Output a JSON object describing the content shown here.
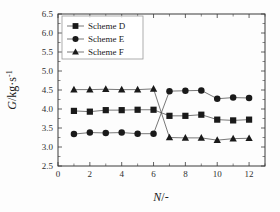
{
  "chart_data": {
    "type": "line",
    "title": "",
    "xlabel": "N/-",
    "ylabel": "G/kg·s⁻¹",
    "ylabel_main": "G",
    "ylabel_unit": "/kg·s",
    "ylabel_exp": "-1",
    "xlabel_main": "N",
    "xlabel_unit": "/-",
    "xlim": [
      0,
      13
    ],
    "ylim": [
      2.5,
      6.5
    ],
    "grid": false,
    "legend_position": "upper-left",
    "x_ticks": [
      0,
      2,
      4,
      6,
      8,
      10,
      12
    ],
    "x_tick_labels": [
      "0",
      "2",
      "4",
      "6",
      "8",
      "10",
      "12"
    ],
    "x_minor_ticks": [
      1,
      3,
      5,
      7,
      9,
      11,
      13
    ],
    "y_ticks": [
      2.5,
      3.0,
      3.5,
      4.0,
      4.5,
      5.0,
      5.5,
      6.0,
      6.5
    ],
    "y_tick_labels": [
      "2.5",
      "3.0",
      "3.5",
      "4.0",
      "4.5",
      "5.0",
      "5.5",
      "6.0",
      "6.5"
    ],
    "x": [
      1,
      2,
      3,
      4,
      5,
      6,
      7,
      8,
      9,
      10,
      11,
      12
    ],
    "series": [
      {
        "name": "Scheme  D",
        "marker": "square",
        "color": "#1a1a1a",
        "values": [
          3.95,
          3.93,
          3.97,
          3.97,
          3.98,
          3.98,
          3.82,
          3.82,
          3.85,
          3.72,
          3.7,
          3.72
        ]
      },
      {
        "name": "Scheme  E",
        "marker": "circle",
        "color": "#1a1a1a",
        "values": [
          3.34,
          3.38,
          3.37,
          3.38,
          3.35,
          3.35,
          4.47,
          4.48,
          4.49,
          4.27,
          4.3,
          4.29
        ]
      },
      {
        "name": "Scheme  F",
        "marker": "triangle",
        "color": "#1a1a1a",
        "values": [
          4.51,
          4.51,
          4.52,
          4.51,
          4.51,
          4.53,
          3.25,
          3.24,
          3.24,
          3.18,
          3.22,
          3.23
        ]
      }
    ]
  },
  "legend": {
    "items": [
      {
        "label": "Scheme  D",
        "marker": "square"
      },
      {
        "label": "Scheme  E",
        "marker": "circle"
      },
      {
        "label": "Scheme  F",
        "marker": "triangle"
      }
    ]
  },
  "colors": {
    "axis": "#3a3a3a",
    "text": "#1a1a1a",
    "marker": "#1a1a1a",
    "line": "#555555",
    "background": "#fdfdfd"
  }
}
